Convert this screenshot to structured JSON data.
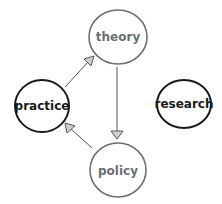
{
  "diagram": {
    "nodes": [
      {
        "id": "theory",
        "label": "theory",
        "cx": 118,
        "cy": 37,
        "rx": 29,
        "ry": 27,
        "stroke": "#6e6e6e",
        "text_color": "#6e6e6e",
        "emphasis": "muted"
      },
      {
        "id": "practice",
        "label": "practice",
        "cx": 42,
        "cy": 106,
        "rx": 27,
        "ry": 26,
        "stroke": "#1a1a1a",
        "text_color": "#1a1a1a",
        "emphasis": "strong"
      },
      {
        "id": "research",
        "label": "research",
        "cx": 184,
        "cy": 104,
        "rx": 27,
        "ry": 24,
        "stroke": "#1a1a1a",
        "text_color": "#1a1a1a",
        "emphasis": "strong"
      },
      {
        "id": "policy",
        "label": "policy",
        "cx": 118,
        "cy": 170,
        "rx": 28,
        "ry": 27,
        "stroke": "#6e6e6e",
        "text_color": "#6e6e6e",
        "emphasis": "muted"
      }
    ],
    "edges": [
      {
        "from": "practice",
        "to": "theory"
      },
      {
        "from": "theory",
        "to": "policy"
      },
      {
        "from": "policy",
        "to": "practice"
      }
    ],
    "colors": {
      "edge": "#555555",
      "arrowhead_fill": "#d0d0d0",
      "background": "#ffffff"
    }
  }
}
